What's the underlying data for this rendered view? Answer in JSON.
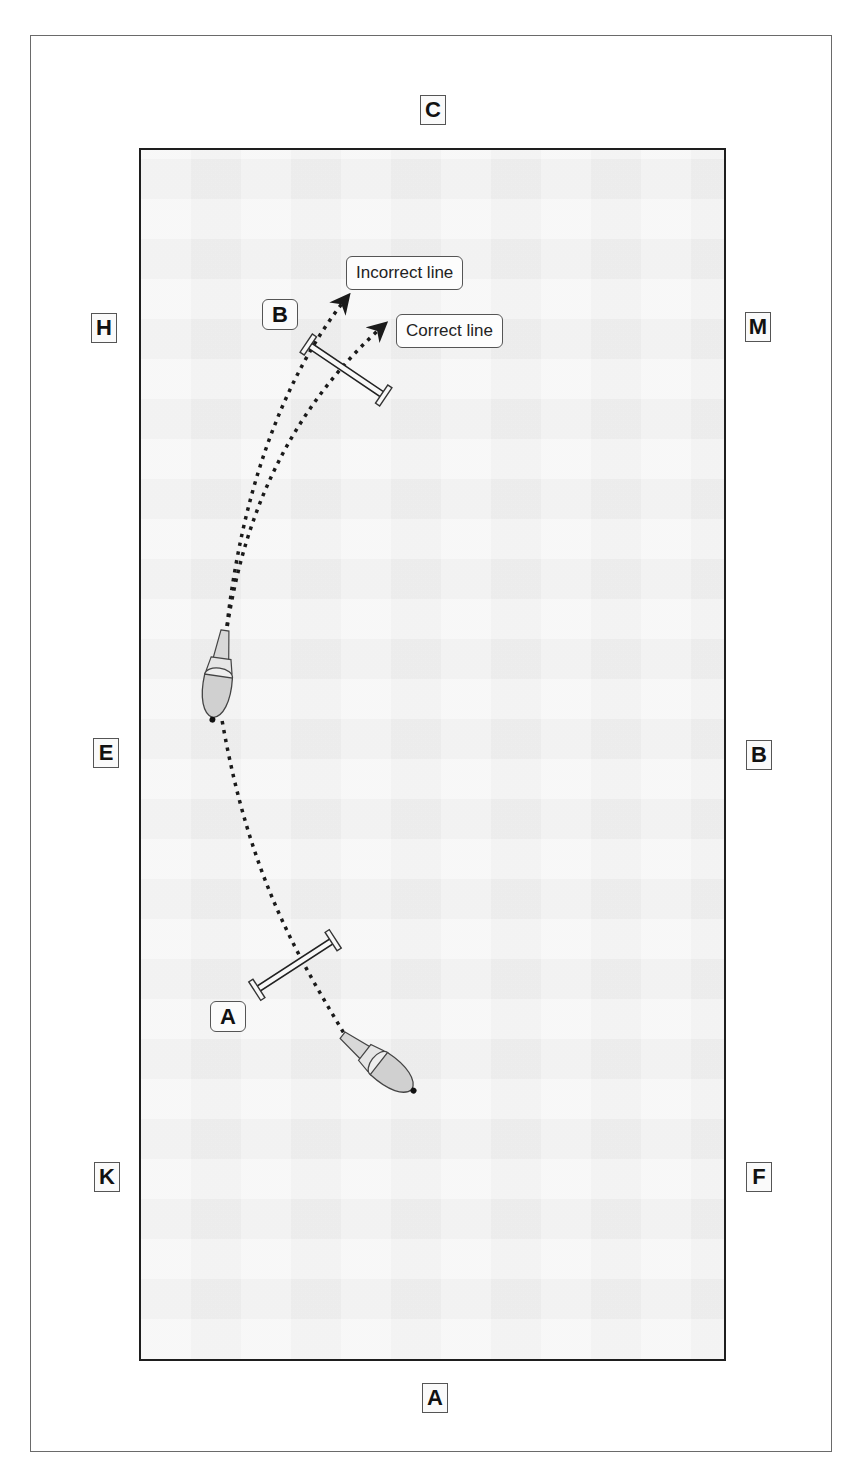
{
  "diagram": {
    "type": "dressage arena riding line diagram",
    "arena_letters": {
      "top": "C",
      "bottom": "A",
      "left_upper": "H",
      "left_middle": "E",
      "left_lower": "K",
      "right_upper": "M",
      "right_middle": "B",
      "right_lower": "F"
    },
    "fences": [
      {
        "id": "A",
        "label": "A"
      },
      {
        "id": "B",
        "label": "B"
      }
    ],
    "callouts": {
      "incorrect": "Incorrect line",
      "correct": "Correct line"
    },
    "riders": [
      {
        "name": "rider-near-fence-a",
        "position": "lower right, approaching fence A"
      },
      {
        "name": "rider-near-e",
        "position": "left side near E, heading to fence B"
      }
    ],
    "colors": {
      "arena_fill": "#f2f2f2",
      "arena_border": "#1e1e1e",
      "frame_border": "#6a6a6a",
      "path": "#1a1a1a",
      "label_border": "#555555"
    }
  }
}
